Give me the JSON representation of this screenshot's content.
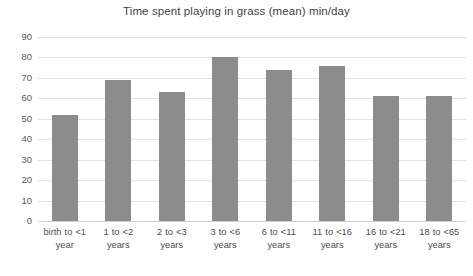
{
  "chart_data": {
    "type": "bar",
    "title": "Time spent playing in grass (mean) min/day",
    "xlabel": "",
    "ylabel": "",
    "categories": [
      "birth to <1 year",
      "1 to <2 years",
      "2 to <3 years",
      "3 to <6 years",
      "6 to <11 years",
      "11 to <16 years",
      "16 to <21 years",
      "18 to <65 years"
    ],
    "values": [
      52,
      69,
      63,
      80,
      74,
      76,
      61,
      61
    ],
    "ylim": [
      0,
      90
    ],
    "yticks": [
      0,
      10,
      20,
      30,
      40,
      50,
      60,
      70,
      80,
      90
    ],
    "ytick_labels": [
      "0",
      "10",
      "20",
      "30",
      "40",
      "50",
      "60",
      "70",
      "80",
      "90"
    ],
    "grid": true,
    "legend": false,
    "bar_color": "#8c8c8c",
    "grid_color": "#e2e2e2",
    "text_color": "#4d4d4d"
  }
}
